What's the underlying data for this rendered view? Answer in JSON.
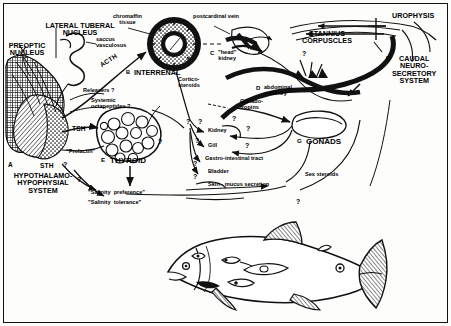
{
  "figure": {
    "type": "schematic-diagram",
    "style": "black-and-white line drawing, halftone stipple shading"
  },
  "major_systems": [
    {
      "marker": "A",
      "label": "HYPOTHALAMO-\nHYPOPHYSIAL\nSYSTEM"
    },
    {
      "marker": "B",
      "label": "INTERRENAL"
    },
    {
      "marker": "C",
      "label": "\"head\"\nkidney"
    },
    {
      "marker": "D",
      "label": "abdominal\nkidney"
    },
    {
      "marker": "E",
      "label": "THYROID"
    },
    {
      "marker": "F",
      "label": "CAUDAL\nNEURO-\nSECRETORY\nSYSTEM"
    },
    {
      "marker": "G",
      "label": "GONADS"
    }
  ],
  "brain_labels": {
    "lateral_tuberal": "LATERAL TUBERAL\nNUCLEUS",
    "preoptic": "PREOPTIC\nNUCLEUS",
    "saccus": "saccus\nvasculosus"
  },
  "top_labels": {
    "chromaffin": "chromaffin\ntissue",
    "postcardinal": "postcardinal vein",
    "urophysis": "UROPHYSIS",
    "stannius": "STANNIUS\nCORPUSCLES"
  },
  "hormones": [
    {
      "name": "ACTH"
    },
    {
      "name": "TSH"
    },
    {
      "name": "STH"
    },
    {
      "name": "\"Prolactin\""
    },
    {
      "name": "Releasers ?"
    },
    {
      "name": "Systemic\noctapeptides ?"
    },
    {
      "name": "Cortico-\nsteroids"
    },
    {
      "name": "Gonado-\ntropins"
    },
    {
      "name": "Sex steroids"
    }
  ],
  "target_organs": [
    "Kidney",
    "Gill",
    "Gastro-intestinal tract",
    "Bladder",
    "Skin - mucus secretion"
  ],
  "behaviors": [
    "\"Salinity  preference\"",
    "\"Salinity  tolerance\""
  ],
  "question_marks": {
    "glyph": "?",
    "count": 12,
    "meaning": "uncertain or hypothesized pathway"
  },
  "fish": {
    "organ_markers": [
      "A",
      "B",
      "C",
      "D",
      "E",
      "F",
      "G"
    ],
    "description": "lateral view of salmonid fish with endocrine organ sites marked"
  },
  "colors": {
    "ink": "#111111",
    "paper": "#fdfdfc",
    "shade": "#5a5a5a"
  }
}
